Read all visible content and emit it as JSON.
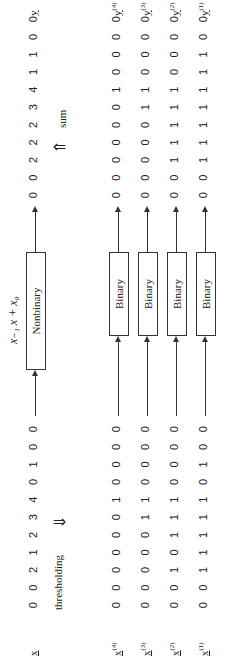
{
  "input_label": "x",
  "output_label": "y",
  "input_sequence": [
    "0",
    "0",
    "2",
    "1",
    "2",
    "3",
    "4",
    "0",
    "1",
    "0",
    "0"
  ],
  "output_sequence": [
    "0",
    "0",
    "2",
    "2",
    "2",
    "3",
    "4",
    "1",
    "1",
    "0",
    "0"
  ],
  "nonbinary_filter": {
    "label": "Nonbinary",
    "formula": "x₋₁ x + x₀"
  },
  "thresholding_label": "thresholding",
  "sum_label": "sum",
  "threshold_levels": [
    {
      "level": "(4)",
      "input": [
        "0",
        "0",
        "0",
        "0",
        "0",
        "0",
        "1",
        "0",
        "0",
        "0",
        "0"
      ],
      "output": [
        "0",
        "0",
        "0",
        "0",
        "0",
        "0",
        "1",
        "0",
        "0",
        "0",
        "0"
      ],
      "box": "Binary"
    },
    {
      "level": "(3)",
      "input": [
        "0",
        "0",
        "0",
        "0",
        "0",
        "1",
        "1",
        "0",
        "0",
        "0",
        "0"
      ],
      "output": [
        "0",
        "0",
        "0",
        "0",
        "0",
        "1",
        "1",
        "0",
        "0",
        "0",
        "0"
      ],
      "box": "Binary"
    },
    {
      "level": "(2)",
      "input": [
        "0",
        "0",
        "1",
        "0",
        "1",
        "1",
        "1",
        "0",
        "0",
        "0",
        "0"
      ],
      "output": [
        "0",
        "0",
        "1",
        "1",
        "1",
        "1",
        "1",
        "0",
        "0",
        "0",
        "0"
      ],
      "box": "Binary"
    },
    {
      "level": "(1)",
      "input": [
        "0",
        "0",
        "1",
        "1",
        "1",
        "1",
        "1",
        "0",
        "1",
        "0",
        "0"
      ],
      "output": [
        "0",
        "0",
        "1",
        "1",
        "1",
        "1",
        "1",
        "1",
        "1",
        "0",
        "0"
      ],
      "box": "Binary"
    }
  ]
}
